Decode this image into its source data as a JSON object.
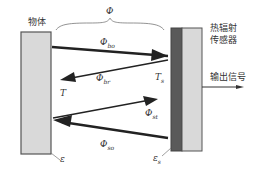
{
  "diagram": {
    "type": "thermal-radiation-exchange",
    "object": {
      "label": "物体",
      "temperature_label": "T",
      "emissivity_label": "ε",
      "fill": "#d9d9d9",
      "stroke": "#555555"
    },
    "sensor": {
      "label_line1": "热辐射",
      "label_line2": "传感器",
      "temperature_label": "T",
      "temperature_sub": "s",
      "emissivity_label": "ε",
      "emissivity_sub": "s",
      "dark_fill": "#5a5a5a",
      "light_fill": "#d9d9d9"
    },
    "output": {
      "label": "输出信号"
    },
    "total_flux": {
      "label": "Φ"
    },
    "fluxes": [
      {
        "id": "bo",
        "symbol": "Φ",
        "sub": "bo",
        "direction": "object-to-sensor"
      },
      {
        "id": "br",
        "symbol": "Φ",
        "sub": "br",
        "direction": "sensor-to-object"
      },
      {
        "id": "st",
        "symbol": "Φ",
        "sub": "st",
        "direction": "object-to-sensor"
      },
      {
        "id": "so",
        "symbol": "Φ",
        "sub": "so",
        "direction": "sensor-to-object"
      }
    ]
  }
}
